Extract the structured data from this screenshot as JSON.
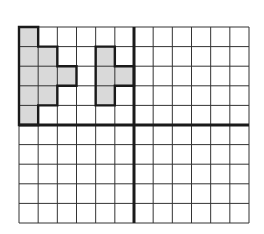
{
  "grid": {
    "columns": 12,
    "rows": 10,
    "origin_x": 19,
    "origin_y": 27,
    "width": 230,
    "height": 196,
    "line_color": "#333333",
    "axis_color": "#1a1a1a",
    "axis_column_index": 6,
    "axis_row_index": 5
  },
  "shapes": [
    {
      "name": "shape-left",
      "fill": "#d9d9d9",
      "stroke": "#1a1a1a",
      "cells_outline": [
        [
          0,
          0
        ],
        [
          1,
          0
        ],
        [
          1,
          1
        ],
        [
          2,
          1
        ],
        [
          2,
          2
        ],
        [
          3,
          2
        ],
        [
          3,
          3
        ],
        [
          2,
          3
        ],
        [
          2,
          4
        ],
        [
          1,
          4
        ],
        [
          1,
          5
        ],
        [
          0,
          5
        ]
      ]
    },
    {
      "name": "shape-right",
      "fill": "#d9d9d9",
      "stroke": "#1a1a1a",
      "cells_outline": [
        [
          4,
          1
        ],
        [
          5,
          1
        ],
        [
          5,
          2
        ],
        [
          6,
          2
        ],
        [
          6,
          3
        ],
        [
          5,
          3
        ],
        [
          5,
          4
        ],
        [
          4,
          4
        ]
      ]
    }
  ]
}
